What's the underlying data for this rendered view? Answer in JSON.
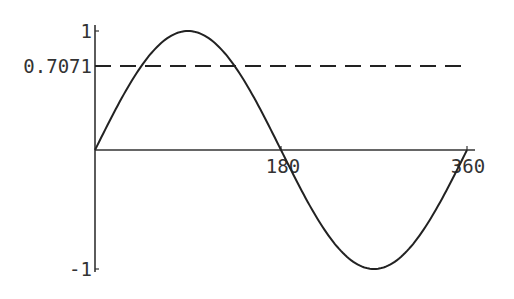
{
  "chart_data": {
    "type": "line",
    "title": "",
    "xlabel": "",
    "ylabel": "",
    "xlim": [
      0,
      360
    ],
    "ylim": [
      -1,
      1
    ],
    "grid": false,
    "legend": null,
    "x_ticks": [
      180,
      360
    ],
    "x_tick_labels": [
      "180",
      "360"
    ],
    "y_ticks": [
      1,
      0.7071,
      -1
    ],
    "y_tick_labels": [
      "1",
      "0.7071",
      "-1"
    ],
    "series": [
      {
        "name": "sin(x)",
        "style": "solid",
        "color": "#222222",
        "x": [
          0,
          30,
          45,
          60,
          90,
          120,
          135,
          150,
          180,
          210,
          240,
          270,
          300,
          330,
          360
        ],
        "values": [
          0,
          0.5,
          0.7071,
          0.866,
          1,
          0.866,
          0.7071,
          0.5,
          0,
          -0.5,
          -0.866,
          -1,
          -0.866,
          -0.5,
          0
        ]
      },
      {
        "name": "y = 0.7071",
        "style": "dashed",
        "color": "#222222",
        "x": [
          0,
          360
        ],
        "values": [
          0.7071,
          0.7071
        ]
      }
    ]
  }
}
